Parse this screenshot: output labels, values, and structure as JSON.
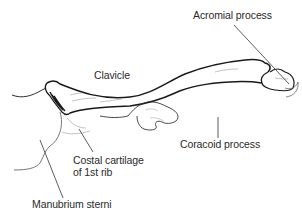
{
  "diagram": {
    "labels": {
      "clavicle": "Clavicle",
      "acromial_process": "Acromial process",
      "coracoid_process": "Coracoid process",
      "costal_cartilage_line1": "Costal cartilage",
      "costal_cartilage_line2": "of 1st rib",
      "manubrium_sterni": "Manubrium sterni"
    },
    "colors": {
      "outline": "#1a1a1a",
      "leader_line": "#333333",
      "shading": "#9a9a9a",
      "background": "#ffffff"
    }
  }
}
